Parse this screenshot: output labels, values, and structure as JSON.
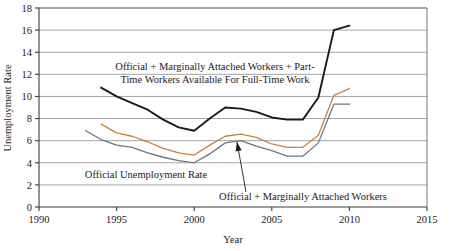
{
  "chart_data": {
    "type": "line",
    "title": "",
    "xlabel": "Year",
    "ylabel": "Unemployment Rate",
    "xlim": [
      1990,
      2015
    ],
    "ylim": [
      0,
      18
    ],
    "xticks": [
      1990,
      1995,
      2000,
      2005,
      2010,
      2015
    ],
    "yticks": [
      0,
      2,
      4,
      6,
      8,
      10,
      12,
      14,
      16,
      18
    ],
    "grid": true,
    "legend_position": "inline-annotations",
    "series": [
      {
        "name": "Official + Marginally Attached Workers + Part-Time Workers Available For Full-Time Work",
        "color": "#1a1a1a",
        "x": [
          1994,
          1995,
          1996,
          1997,
          1998,
          1999,
          2000,
          2001,
          2002,
          2003,
          2004,
          2005,
          2006,
          2007,
          2008,
          2009,
          2010
        ],
        "values": [
          10.8,
          10.0,
          9.4,
          8.8,
          7.9,
          7.2,
          6.9,
          8.0,
          9.0,
          8.9,
          8.6,
          8.1,
          7.9,
          7.9,
          9.9,
          16.0,
          16.4
        ]
      },
      {
        "name": "Official + Marginally Attached Workers",
        "color": "#c8813f",
        "x": [
          1994,
          1995,
          1996,
          1997,
          1998,
          1999,
          2000,
          2001,
          2002,
          2003,
          2004,
          2005,
          2006,
          2007,
          2008,
          2009,
          2010
        ],
        "values": [
          7.5,
          6.7,
          6.4,
          5.9,
          5.3,
          4.9,
          4.7,
          5.6,
          6.4,
          6.6,
          6.3,
          5.7,
          5.4,
          5.4,
          6.5,
          10.1,
          10.7
        ]
      },
      {
        "name": "Official Unemployment Rate",
        "color": "#6f7480",
        "x": [
          1993,
          1994,
          1995,
          1996,
          1997,
          1998,
          1999,
          2000,
          2001,
          2002,
          2003,
          2004,
          2005,
          2006,
          2007,
          2008,
          2009,
          2010
        ],
        "values": [
          6.9,
          6.1,
          5.6,
          5.4,
          4.9,
          4.5,
          4.2,
          4.0,
          4.8,
          5.8,
          6.0,
          5.5,
          5.1,
          4.6,
          4.6,
          5.8,
          9.3,
          9.3
        ]
      }
    ],
    "annotations": [
      {
        "id": "annotation-u6",
        "lines": [
          "Official + Marginally Attached Workers + Part-",
          "Time Workers Available For Full-Time Work"
        ],
        "x": 113,
        "y": 70
      },
      {
        "id": "annotation-official",
        "lines": [
          "Official Unemployment Rate"
        ],
        "x": 77,
        "y": 178
      },
      {
        "id": "annotation-marginally-attached",
        "lines": [
          "Official + Marginally Attached Workers"
        ],
        "x": 164,
        "y": 200
      }
    ],
    "arrow": {
      "id": "arrow-to-marginally-attached",
      "from_x": 246,
      "from_y": 192,
      "to_x": 237,
      "to_y": 142
    }
  }
}
